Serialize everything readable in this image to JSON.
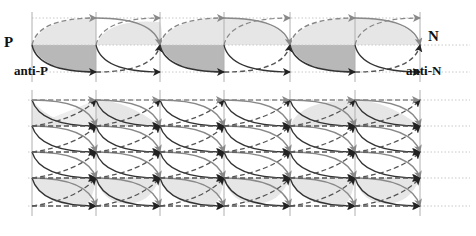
{
  "diagram": {
    "type": "oscillation-lattice",
    "top_panel": {
      "labels": {
        "left_top": "P",
        "left_bottom": "anti-P",
        "right_top": "N",
        "right_bottom": "anti-N"
      },
      "columns_x": [
        32,
        96,
        160,
        224,
        290,
        355,
        420
      ],
      "rows_y": {
        "top": 18,
        "middle": 45,
        "bottom": 72
      }
    },
    "bottom_panel": {
      "rows_y": [
        100,
        126,
        152,
        178,
        206
      ],
      "columns_x": [
        32,
        96,
        160,
        224,
        290,
        355,
        420
      ]
    },
    "colors": {
      "grid_line": "#b0b0b0",
      "solid_arc": "#333333",
      "dashed_arc": "#555555",
      "gray_arc": "#888888",
      "fill_light": "#e6e6e6",
      "fill_dark": "#b8b8b8",
      "dotted_guide": "#c8c8c8"
    }
  }
}
